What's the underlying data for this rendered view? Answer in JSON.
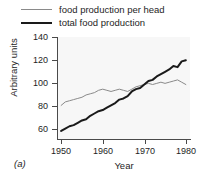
{
  "panel": {
    "label": "(a)"
  },
  "legend": {
    "position": "above-plot",
    "items": [
      {
        "label": "food production per head",
        "color": "#8a8a8a",
        "width": 1,
        "icon": "line-swatch-icon"
      },
      {
        "label": "total food production",
        "color": "#1a1a1a",
        "width": 2,
        "icon": "line-swatch-icon"
      }
    ]
  },
  "axes": {
    "y": {
      "label": "Arbitrary units",
      "ticks": [
        60,
        80,
        100,
        120,
        140
      ],
      "min": 52,
      "max": 140
    },
    "x": {
      "label": "Year",
      "ticks": [
        1950,
        1960,
        1970,
        1980
      ],
      "min": 1949,
      "max": 1981
    }
  },
  "chart_data": {
    "type": "line",
    "title": "",
    "subtitle": "",
    "xlabel": "Year",
    "ylabel": "Arbitrary units",
    "xlim": [
      1949,
      1981
    ],
    "ylim": [
      52,
      140
    ],
    "xticks": [
      1950,
      1960,
      1970,
      1980
    ],
    "yticks": [
      60,
      80,
      100,
      120,
      140
    ],
    "grid": false,
    "legend_position": "above-plot",
    "annotations": [
      "(a)"
    ],
    "x": [
      1950,
      1951,
      1952,
      1953,
      1954,
      1955,
      1956,
      1957,
      1958,
      1959,
      1960,
      1961,
      1962,
      1963,
      1964,
      1965,
      1966,
      1967,
      1968,
      1969,
      1970,
      1971,
      1972,
      1973,
      1974,
      1975,
      1976,
      1977,
      1978,
      1979,
      1980
    ],
    "series": [
      {
        "name": "food production per head",
        "color": "#8a8a8a",
        "linewidth": 1,
        "values": [
          81,
          84,
          85,
          86,
          87,
          88,
          90,
          91,
          92,
          94,
          95,
          94,
          93,
          94,
          95,
          94,
          93,
          95,
          97,
          98,
          99,
          100,
          99,
          100,
          101,
          100,
          101,
          102,
          103,
          101,
          99
        ]
      },
      {
        "name": "total food production",
        "color": "#1a1a1a",
        "linewidth": 2,
        "values": [
          59,
          61,
          63,
          64,
          66,
          68,
          69,
          72,
          74,
          76,
          77,
          79,
          81,
          83,
          86,
          87,
          89,
          93,
          95,
          96,
          99,
          102,
          103,
          106,
          108,
          110,
          112,
          115,
          114,
          119,
          120
        ]
      }
    ]
  }
}
